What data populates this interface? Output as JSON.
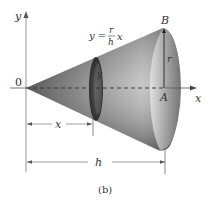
{
  "figure": {
    "caption": "(b)",
    "axes": {
      "x_label": "x",
      "y_label": "y",
      "origin_label": "0"
    },
    "points": {
      "B": "B",
      "A": "A"
    },
    "equation": {
      "lhs": "y =",
      "numerator": "r",
      "denominator": "h",
      "variable": "x"
    },
    "radius_label": "r",
    "disk_radius_label": "y",
    "dimensions": {
      "x_label": "x",
      "h_label": "h"
    },
    "colors": {
      "axis": "#7a7a7a",
      "cone_dark": "#2a2a2a",
      "cone_light": "#d8d8d8",
      "text": "#333333"
    }
  }
}
